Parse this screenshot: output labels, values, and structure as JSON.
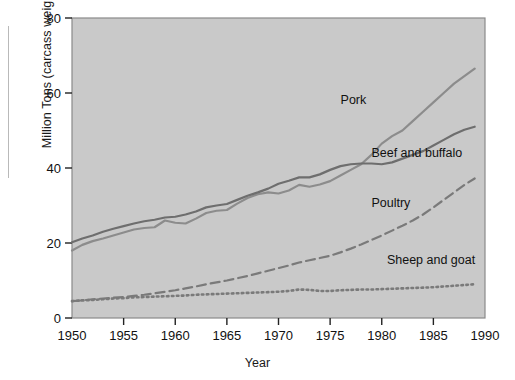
{
  "figure": {
    "name": "world-meat-production-by-type-1950-1990"
  },
  "chart_data": {
    "type": "line",
    "title": "",
    "xlabel": "Year",
    "ylabel": "Million Tons (carcass weight)",
    "xlim": [
      1950,
      1990
    ],
    "ylim": [
      0,
      80
    ],
    "xticks": [
      1950,
      1955,
      1960,
      1965,
      1970,
      1975,
      1980,
      1985,
      1990
    ],
    "yticks": [
      0,
      20,
      40,
      60,
      80
    ],
    "grid": false,
    "legend_position": "inline-annotations",
    "plot_background": "#c9c9c9",
    "x": [
      1950,
      1951,
      1952,
      1953,
      1954,
      1955,
      1956,
      1957,
      1958,
      1959,
      1960,
      1961,
      1962,
      1963,
      1964,
      1965,
      1966,
      1967,
      1968,
      1969,
      1970,
      1971,
      1972,
      1973,
      1974,
      1975,
      1976,
      1977,
      1978,
      1979,
      1980,
      1981,
      1982,
      1983,
      1984,
      1985,
      1986,
      1987,
      1988,
      1989
    ],
    "series": [
      {
        "name": "Pork",
        "style": "solid",
        "color": "#8c8c8c",
        "label": "Pork",
        "values": [
          18.0,
          19.5,
          20.5,
          21.2,
          22.0,
          22.8,
          23.6,
          24.0,
          24.2,
          26.0,
          25.4,
          25.2,
          26.5,
          28.0,
          28.6,
          28.8,
          30.5,
          32.0,
          33.0,
          33.5,
          33.2,
          34.0,
          35.5,
          35.0,
          35.6,
          36.5,
          38.0,
          39.5,
          41.0,
          43.5,
          46.5,
          48.5,
          50.0,
          52.5,
          55.0,
          57.5,
          60.0,
          62.5,
          64.5,
          66.5
        ]
      },
      {
        "name": "Beef and buffalo",
        "style": "solid",
        "color": "#6e6e6e",
        "label": "Beef and buffalo",
        "values": [
          20.2,
          21.2,
          22.0,
          23.0,
          23.8,
          24.5,
          25.2,
          25.8,
          26.2,
          26.8,
          27.0,
          27.6,
          28.4,
          29.5,
          30.0,
          30.4,
          31.5,
          32.6,
          33.5,
          34.5,
          35.8,
          36.6,
          37.5,
          37.5,
          38.3,
          39.5,
          40.5,
          41.0,
          41.2,
          41.2,
          41.0,
          41.5,
          42.5,
          43.5,
          44.5,
          46.0,
          47.5,
          49.0,
          50.2,
          51.0
        ]
      },
      {
        "name": "Poultry",
        "style": "dashed",
        "color": "#7a7a7a",
        "label": "Poultry",
        "values": [
          4.5,
          4.7,
          5.0,
          5.2,
          5.4,
          5.6,
          5.9,
          6.2,
          6.6,
          7.0,
          7.4,
          7.9,
          8.4,
          9.0,
          9.5,
          10.0,
          10.6,
          11.2,
          11.9,
          12.6,
          13.3,
          14.0,
          14.8,
          15.4,
          16.0,
          16.6,
          17.5,
          18.5,
          19.6,
          20.8,
          22.0,
          23.3,
          24.6,
          26.0,
          27.6,
          29.5,
          31.5,
          33.5,
          35.5,
          37.2
        ]
      },
      {
        "name": "Sheep and goat",
        "style": "dotted",
        "color": "#7a7a7a",
        "label": "Sheep and goat",
        "values": [
          4.5,
          4.7,
          4.8,
          5.0,
          5.2,
          5.3,
          5.5,
          5.6,
          5.7,
          5.8,
          5.9,
          6.0,
          6.2,
          6.3,
          6.4,
          6.5,
          6.6,
          6.7,
          6.8,
          6.9,
          7.0,
          7.2,
          7.6,
          7.5,
          7.2,
          7.2,
          7.4,
          7.5,
          7.6,
          7.6,
          7.7,
          7.8,
          7.9,
          8.0,
          8.1,
          8.2,
          8.4,
          8.6,
          8.8,
          9.0
        ]
      }
    ],
    "annotations": [
      {
        "text": "Pork",
        "x": 1978.5,
        "y": 57.0,
        "anchor": "end"
      },
      {
        "text": "Beef and buffalo",
        "x": 1979.0,
        "y": 43.0,
        "anchor": "start"
      },
      {
        "text": "Poultry",
        "x": 1979.0,
        "y": 29.5,
        "anchor": "start"
      },
      {
        "text": "Sheep and goat",
        "x": 1980.5,
        "y": 14.5,
        "anchor": "start"
      }
    ]
  }
}
